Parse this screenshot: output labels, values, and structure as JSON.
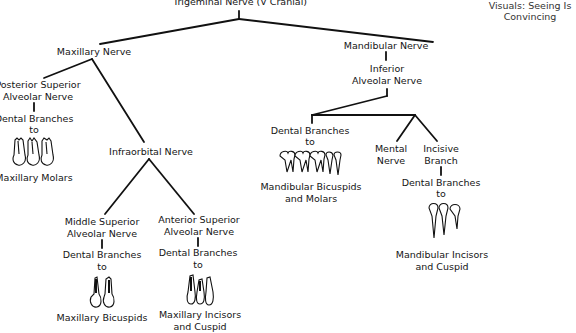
{
  "caption": {
    "line1": "Visuals: Seeing Is",
    "line2": "Convincing"
  },
  "tree": {
    "root": "Trigeminal Nerve (V Cranial)",
    "maxillary": {
      "label": "Maxillary Nerve",
      "posterior": {
        "line1": "Posterior Superior",
        "line2": "Alveolar Nerve",
        "branch1": "Dental Branches",
        "branch2": "to",
        "target": "Maxillary Molars",
        "teeth_icon": "maxillary-molars-icon"
      },
      "infraorbital": {
        "label": "Infraorbital Nerve",
        "middle": {
          "line1": "Middle Superior",
          "line2": "Alveolar Nerve",
          "branch1": "Dental Branches",
          "branch2": "to",
          "target": "Maxillary Bicuspids",
          "teeth_icon": "maxillary-bicuspids-icon"
        },
        "anterior": {
          "line1": "Anterior Superior",
          "line2": "Alveolar Nerve",
          "branch1": "Dental Branches",
          "branch2": "to",
          "target1": "Maxillary Incisors",
          "target2": "and Cuspid",
          "teeth_icon": "maxillary-incisors-cuspid-icon"
        }
      }
    },
    "mandibular": {
      "label": "Mandibular Nerve",
      "inferior": {
        "line1": "Inferior",
        "line2": "Alveolar Nerve",
        "dental": {
          "branch1": "Dental Branches",
          "branch2": "to",
          "target1": "Mandibular Bicuspids",
          "target2": "and Molars",
          "teeth_icon": "mandibular-bicuspids-molars-icon"
        },
        "mental": {
          "line1": "Mental",
          "line2": "Nerve"
        },
        "incisive": {
          "line1": "Incisive",
          "line2": "Branch",
          "branch1": "Dental Branches",
          "branch2": "to",
          "target1": "Mandibular Incisors",
          "target2": "and Cuspid",
          "teeth_icon": "mandibular-incisors-cuspid-icon"
        }
      }
    }
  }
}
